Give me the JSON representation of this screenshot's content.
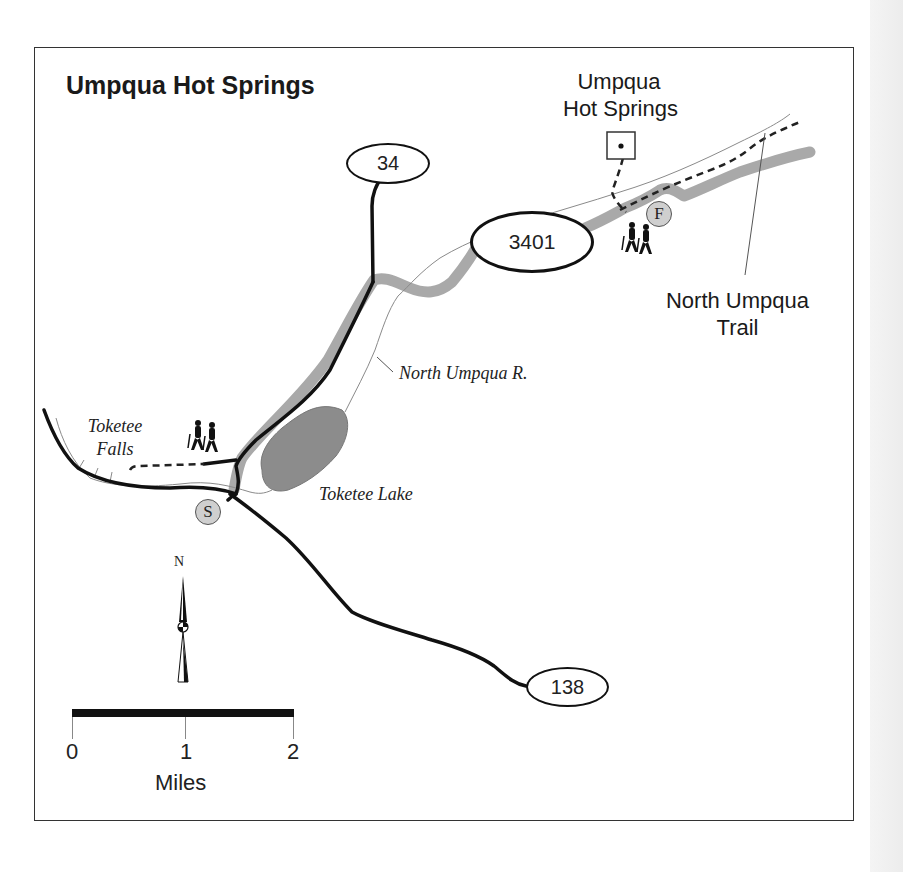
{
  "map": {
    "title": "Umpqua Hot Springs",
    "colors": {
      "road": "#111111",
      "paved_highlight": "#a9a9a9",
      "river": "#9a9a9a",
      "lake": "#8c8c8c",
      "trail": "#222222",
      "badge_fill": "#cfcfcf",
      "frame": "#333333"
    },
    "road_shields": [
      {
        "id": "road-34",
        "label": "34"
      },
      {
        "id": "road-3401",
        "label": "3401"
      },
      {
        "id": "road-138",
        "label": "138"
      }
    ],
    "labels": {
      "hot_springs": "Umpqua\nHot Springs",
      "hot_springs_line1": "Umpqua",
      "hot_springs_line2": "Hot Springs",
      "north_umpqua_trail_line1": "North Umpqua",
      "north_umpqua_trail_line2": "Trail",
      "river": "North Umpqua R.",
      "toketee_falls_line1": "Toketee",
      "toketee_falls_line2": "Falls",
      "toketee_lake": "Toketee Lake"
    },
    "markers": {
      "start": "S",
      "finish": "F"
    },
    "icons": [
      "hikers-icon",
      "hikers-icon",
      "hot-spring-icon",
      "north-arrow-icon"
    ],
    "north_arrow": {
      "label": "N"
    },
    "scale": {
      "ticks": [
        "0",
        "1",
        "2"
      ],
      "unit": "Miles"
    }
  }
}
